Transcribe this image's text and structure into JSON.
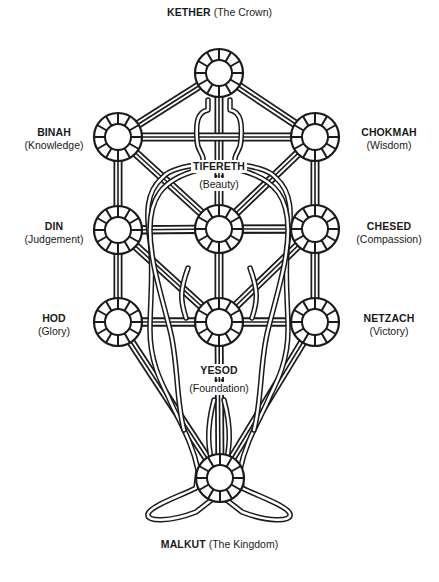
{
  "diagram": {
    "colors": {
      "ink": "#1a1a1a",
      "paper": "#ffffff"
    },
    "sephirot": [
      {
        "id": "kether",
        "name": "KETHER",
        "meaning": "(The Crown)",
        "cx": 219,
        "cy": 73
      },
      {
        "id": "binah",
        "name": "BINAH",
        "meaning": "(Knowledge)",
        "cx": 118,
        "cy": 137
      },
      {
        "id": "chokmah",
        "name": "CHOKMAH",
        "meaning": "(Wisdom)",
        "cx": 315,
        "cy": 137
      },
      {
        "id": "din",
        "name": "DIN",
        "meaning": "(Judgement)",
        "cx": 118,
        "cy": 230
      },
      {
        "id": "tifereth",
        "name": "TIFERETH",
        "meaning": "(Beauty)",
        "cx": 219,
        "cy": 229
      },
      {
        "id": "chesed",
        "name": "CHESED",
        "meaning": "(Compassion)",
        "cx": 315,
        "cy": 229
      },
      {
        "id": "hod",
        "name": "HOD",
        "meaning": "(Glory)",
        "cx": 118,
        "cy": 322
      },
      {
        "id": "yesod",
        "name": "YESOD",
        "meaning": "(Foundation)",
        "cx": 219,
        "cy": 322
      },
      {
        "id": "netzach",
        "name": "NETZACH",
        "meaning": "(Victory)",
        "cx": 315,
        "cy": 322
      },
      {
        "id": "malkut",
        "name": "MALKUT",
        "meaning": "(The Kingdom)",
        "cx": 220,
        "cy": 478
      }
    ],
    "paths": [
      [
        "kether",
        "binah"
      ],
      [
        "kether",
        "chokmah"
      ],
      [
        "kether",
        "tifereth"
      ],
      [
        "binah",
        "chokmah"
      ],
      [
        "binah",
        "din"
      ],
      [
        "binah",
        "tifereth"
      ],
      [
        "chokmah",
        "chesed"
      ],
      [
        "chokmah",
        "tifereth"
      ],
      [
        "din",
        "chesed"
      ],
      [
        "din",
        "tifereth"
      ],
      [
        "din",
        "hod"
      ],
      [
        "din",
        "yesod"
      ],
      [
        "chesed",
        "tifereth"
      ],
      [
        "chesed",
        "netzach"
      ],
      [
        "chesed",
        "yesod"
      ],
      [
        "tifereth",
        "yesod"
      ],
      [
        "hod",
        "netzach"
      ],
      [
        "hod",
        "yesod"
      ],
      [
        "hod",
        "malkut"
      ],
      [
        "netzach",
        "yesod"
      ],
      [
        "netzach",
        "malkut"
      ],
      [
        "yesod",
        "malkut"
      ]
    ],
    "labels": {
      "kether": {
        "name": "KETHER",
        "meaning": "(The Crown)"
      },
      "binah": {
        "name": "BINAH",
        "meaning": "(Knowledge)"
      },
      "chokmah": {
        "name": "CHOKMAH",
        "meaning": "(Wisdom)"
      },
      "din": {
        "name": "DIN",
        "meaning": "(Judgement)"
      },
      "tifereth": {
        "name": "TIFERETH",
        "meaning": "(Beauty)"
      },
      "chesed": {
        "name": "CHESED",
        "meaning": "(Compassion)"
      },
      "hod": {
        "name": "HOD",
        "meaning": "(Glory)"
      },
      "yesod": {
        "name": "YESOD",
        "meaning": "(Foundation)"
      },
      "netzach": {
        "name": "NETZACH",
        "meaning": "(Victory)"
      },
      "malkut": {
        "name": "MALKUT",
        "meaning": "(The Kingdom)"
      }
    },
    "figure": {
      "description": "human-figure-outline",
      "present": true
    }
  }
}
